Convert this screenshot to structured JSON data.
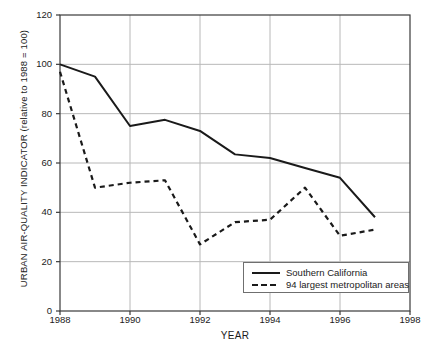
{
  "chart_data": {
    "type": "line",
    "title": "",
    "xlabel": "YEAR",
    "ylabel": "URBAN AIR-QUALITY INDICATOR (relative to 1988 = 100)",
    "xlim": [
      1988,
      1998
    ],
    "ylim": [
      0,
      120
    ],
    "xticks": [
      "1988",
      "1990",
      "1992",
      "1994",
      "1996",
      "1998"
    ],
    "yticks": [
      "0",
      "20",
      "40",
      "60",
      "80",
      "100",
      "120"
    ],
    "grid": true,
    "legend_position": "bottom-right",
    "x": [
      1988,
      1989,
      1990,
      1991,
      1992,
      1993,
      1994,
      1995,
      1996,
      1997
    ],
    "series": [
      {
        "name": "Southern California",
        "style": "solid",
        "color": "#1a1a1a",
        "values": [
          100,
          95,
          75,
          77.5,
          73,
          63.5,
          62,
          58,
          54,
          38
        ]
      },
      {
        "name": "94 largest metropolitan areas",
        "style": "dashed",
        "color": "#1a1a1a",
        "values": [
          97,
          50,
          52,
          53,
          27,
          36,
          37,
          50,
          30.5,
          33
        ]
      }
    ]
  },
  "axes": {
    "frame_color": "#3a3a3a",
    "grid_color": "#b8b8b8"
  },
  "legend": {
    "items": [
      {
        "label": "Southern California"
      },
      {
        "label": "94 largest metropolitan areas"
      }
    ]
  }
}
